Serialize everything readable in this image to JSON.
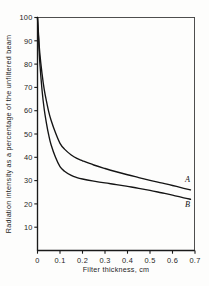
{
  "chart_data": {
    "type": "line",
    "title": "",
    "xlabel": "Filter thickness, cm",
    "ylabel": "Radiation intensity as a percentage of the unfiltered beam",
    "xlim": [
      0,
      0.7
    ],
    "ylim": [
      0,
      100
    ],
    "grid": false,
    "legend_position": "inline-right-end",
    "x_ticks": [
      "0",
      "0.1",
      "0.2",
      "0.3",
      "0.4",
      "0.5",
      "0.6",
      "0.7"
    ],
    "x_tick_values": [
      0,
      0.1,
      0.2,
      0.3,
      0.4,
      0.5,
      0.6,
      0.7
    ],
    "y_ticks": [
      "10",
      "20",
      "30",
      "40",
      "50",
      "60",
      "70",
      "80",
      "90",
      "100"
    ],
    "y_tick_values": [
      10,
      20,
      30,
      40,
      50,
      60,
      70,
      80,
      90,
      100
    ],
    "line_color": "#141414",
    "series": [
      {
        "name": "A",
        "label": "A",
        "x": [
          0,
          0.005,
          0.01,
          0.02,
          0.03,
          0.04,
          0.05,
          0.06,
          0.08,
          0.1,
          0.12,
          0.15,
          0.175,
          0.2,
          0.25,
          0.3,
          0.35,
          0.4,
          0.45,
          0.5,
          0.55,
          0.6,
          0.65,
          0.68
        ],
        "y": [
          100,
          92,
          85,
          76,
          69,
          64,
          59.5,
          56,
          50.5,
          46,
          43.5,
          41,
          39.5,
          38.5,
          36.7,
          35.2,
          33.8,
          32.5,
          31.3,
          30.1,
          29.0,
          27.9,
          26.7,
          26.0
        ],
        "label_x": 0.655,
        "label_y": 29.5
      },
      {
        "name": "B",
        "label": "B",
        "x": [
          0,
          0.005,
          0.01,
          0.02,
          0.03,
          0.04,
          0.05,
          0.06,
          0.08,
          0.1,
          0.12,
          0.15,
          0.175,
          0.2,
          0.25,
          0.3,
          0.35,
          0.4,
          0.45,
          0.5,
          0.55,
          0.6,
          0.65,
          0.68
        ],
        "y": [
          100,
          90,
          81,
          69,
          60.5,
          54.5,
          49.5,
          45.5,
          40,
          36,
          34,
          32.2,
          31.3,
          30.7,
          29.8,
          29.0,
          28.3,
          27.5,
          26.7,
          25.8,
          24.8,
          23.8,
          22.6,
          22.0
        ],
        "label_x": 0.655,
        "label_y": 18.5
      }
    ]
  }
}
